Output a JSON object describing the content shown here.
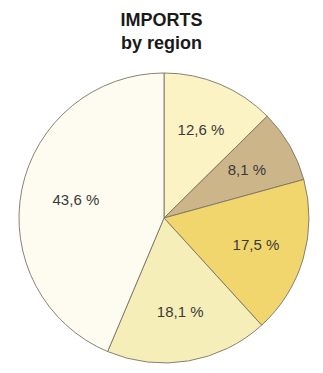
{
  "title": "IMPORTS",
  "subtitle": "by region",
  "chart_data": {
    "type": "pie",
    "title": "IMPORTS",
    "subtitle": "by region",
    "start_angle_deg": 0,
    "direction": "clockwise",
    "slices": [
      {
        "label": "12,6 %",
        "value": 12.6,
        "color": "#fbf3c4"
      },
      {
        "label": "8,1 %",
        "value": 8.1,
        "color": "#cdb58a"
      },
      {
        "label": "17,5 %",
        "value": 17.5,
        "color": "#f1d66e"
      },
      {
        "label": "18,1 %",
        "value": 18.1,
        "color": "#f6eeb8"
      },
      {
        "label": "43,6 %",
        "value": 43.6,
        "color": "#fefcf0"
      }
    ],
    "legend": "none"
  }
}
